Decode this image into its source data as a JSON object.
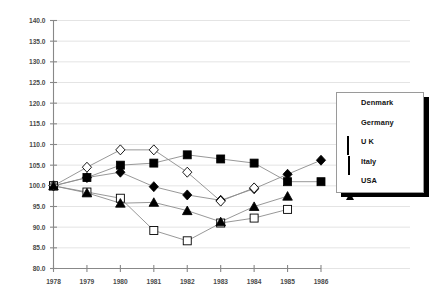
{
  "chart_data": {
    "type": "line",
    "title": "",
    "subtitle": "",
    "xlabel": "",
    "ylabel": "",
    "grid": true,
    "legend_position": "right",
    "x": [
      1978,
      1979,
      1980,
      1981,
      1982,
      1983,
      1984,
      1985,
      1986
    ],
    "categories": [
      "1978",
      "1979",
      "1980",
      "1981",
      "1982",
      "1983",
      "1984",
      "1985",
      "1986"
    ],
    "xtick_labels": [
      "1978",
      "1979",
      "1980",
      "1981",
      "1982",
      "1983",
      "1984",
      "1985",
      "1986"
    ],
    "ytick_labels": [
      "80.0",
      "85.0",
      "90.0",
      "95.0",
      "100.0",
      "105.0",
      "110.0",
      "115.0",
      "120.0",
      "125.0",
      "130.0",
      "135.0",
      "140.0"
    ],
    "ylim": [
      80.0,
      140.0
    ],
    "ytick_step": 5.0,
    "xlim": [
      1978,
      1986
    ],
    "series": [
      {
        "name": "Denmark",
        "marker": "filled-square",
        "color": "#000000",
        "values": [
          100.0,
          102.0,
          105.0,
          105.5,
          107.5,
          106.5,
          105.5,
          101.0,
          101.0
        ]
      },
      {
        "name": "Germany",
        "marker": "filled-diamond",
        "color": "#000000",
        "values": [
          100.0,
          102.0,
          103.3,
          99.8,
          97.8,
          96.5,
          99.3,
          102.8,
          106.2
        ]
      },
      {
        "name": "U K",
        "marker": "open-square",
        "color": "#000000",
        "values": [
          100.0,
          98.5,
          97.0,
          89.2,
          86.7,
          91.0,
          92.2,
          94.3,
          null
        ]
      },
      {
        "name": "Italy",
        "marker": "open-diamond",
        "color": "#000000",
        "values": [
          100.0,
          104.5,
          108.7,
          108.7,
          103.3,
          96.3,
          99.5,
          null,
          null
        ]
      },
      {
        "name": "USA",
        "marker": "filled-triangle",
        "color": "#000000",
        "values": [
          100.0,
          98.3,
          95.8,
          96.0,
          94.0,
          91.3,
          95.0,
          97.5,
          null
        ]
      }
    ]
  },
  "legend": {
    "entries": [
      {
        "label": "Denmark",
        "marker": "filled-square"
      },
      {
        "label": "Germany",
        "marker": "filled-diamond"
      },
      {
        "label": "U K",
        "marker": "open-square"
      },
      {
        "label": "Italy",
        "marker": "open-diamond"
      },
      {
        "label": "USA",
        "marker": "filled-triangle"
      }
    ]
  }
}
